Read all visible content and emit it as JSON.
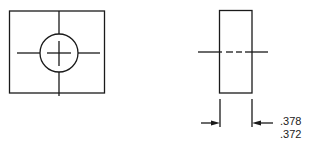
{
  "diagram": {
    "type": "orthographic-drawing",
    "views": [
      {
        "name": "front-view",
        "shape": "square-with-centered-hole",
        "features": [
          "outer-rectangle",
          "circle-hole",
          "center-cross",
          "horizontal-centerline",
          "vertical-centerline"
        ]
      },
      {
        "name": "side-view",
        "shape": "rectangle-with-hidden-hole-centerline",
        "features": [
          "outer-rectangle",
          "dashed-centerline",
          "extension-lines",
          "dimension-arrows"
        ]
      }
    ],
    "dimension": {
      "upper_limit": ".378",
      "lower_limit": ".372"
    },
    "colors": {
      "line": "#1a1a1a",
      "background": "#ffffff"
    }
  }
}
